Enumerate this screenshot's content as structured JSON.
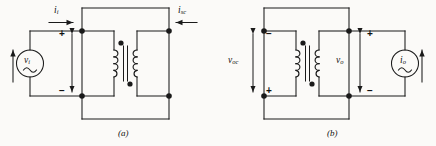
{
  "figure": {
    "background_color": "#fbfaf8",
    "line_color": "#1a1a1a",
    "panels": [
      {
        "id": "a",
        "caption": "(a)",
        "source": {
          "type": "voltage-source",
          "symbol": "v",
          "subscript": "i",
          "waveform": "sine",
          "arrow_direction": "up"
        },
        "port_labels": [
          {
            "name": "input-current",
            "symbol": "i",
            "subscript": "i",
            "arrow_direction": "right"
          },
          {
            "name": "short-circuit-current",
            "symbol": "i",
            "subscript": "sc",
            "arrow_direction": "left"
          }
        ],
        "polarity": [
          {
            "name": "input-plus",
            "sign": "+",
            "position": "top"
          },
          {
            "name": "input-minus",
            "sign": "−",
            "position": "bottom"
          }
        ],
        "transformer": {
          "left_coil_turns": 4,
          "right_coil_turns": 4,
          "left_dot": "top",
          "right_dot": "bottom",
          "core": "vertical-double-line"
        },
        "right_port": "short-circuit"
      },
      {
        "id": "b",
        "caption": "(b)",
        "source": {
          "type": "current-source",
          "symbol": "i",
          "subscript": "o",
          "waveform": "sine",
          "arrow_direction": "up"
        },
        "voltage_labels": [
          {
            "name": "open-circuit-voltage",
            "symbol": "v",
            "subscript": "oc",
            "top_sign": "−",
            "bottom_sign": "+"
          },
          {
            "name": "output-voltage",
            "symbol": "v",
            "subscript": "o",
            "top_sign": "+",
            "bottom_sign": "−"
          }
        ],
        "transformer": {
          "left_coil_turns": 4,
          "right_coil_turns": 4,
          "left_dot": "top",
          "right_dot": "bottom",
          "core": "vertical-double-line"
        },
        "left_port": "open-circuit"
      }
    ]
  }
}
